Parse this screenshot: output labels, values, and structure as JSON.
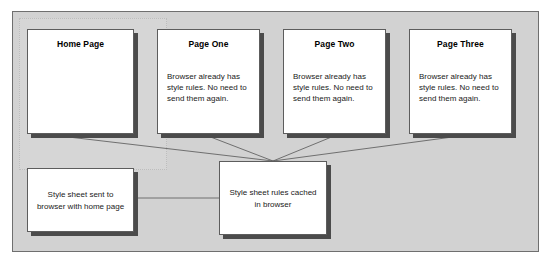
{
  "diagram": {
    "background_color": "#d2d2d2",
    "frame_border_color": "#6f6f6f",
    "node_fill_color": "#ffffff",
    "node_border_color": "#5d5d5d",
    "shadow_color": "#4b4b4b",
    "connector_color": "#555555"
  },
  "nodes": {
    "home": {
      "title": "Home Page",
      "body": ""
    },
    "page_one": {
      "title": "Page One",
      "body": "Browser already has style rules. No need to send them again."
    },
    "page_two": {
      "title": "Page Two",
      "body": "Browser already has style rules. No need to send them again."
    },
    "page_three": {
      "title": "Page Three",
      "body": "Browser already has style rules. No need to send them again."
    },
    "style_sheet_sent": {
      "text": "Style sheet sent to browser with home page"
    },
    "style_sheet_cached": {
      "text": "Style sheet rules cached in browser"
    }
  },
  "connections": [
    {
      "from": "home",
      "to": "style_sheet_cached"
    },
    {
      "from": "page_one",
      "to": "style_sheet_cached"
    },
    {
      "from": "page_two",
      "to": "style_sheet_cached"
    },
    {
      "from": "page_three",
      "to": "style_sheet_cached"
    },
    {
      "from": "style_sheet_sent",
      "to": "style_sheet_cached"
    }
  ]
}
